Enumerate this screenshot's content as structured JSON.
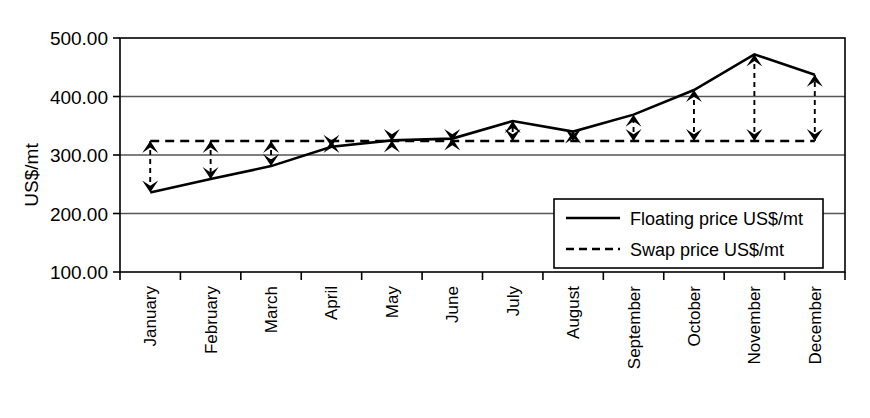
{
  "chart_data": {
    "type": "line",
    "title": "",
    "xlabel": "",
    "ylabel": "US$/mt",
    "ylim": [
      100,
      500
    ],
    "yticks": [
      "100.00",
      "200.00",
      "300.00",
      "400.00",
      "500.00"
    ],
    "ytick_values": [
      100,
      200,
      300,
      400,
      500
    ],
    "grid": true,
    "legend_position": "inside-lower-right",
    "categories": [
      "January",
      "February",
      "March",
      "April",
      "May",
      "June",
      "July",
      "August",
      "September",
      "October",
      "November",
      "December"
    ],
    "series": [
      {
        "name": "Floating price US$/mt",
        "style": "solid",
        "color": "#000000",
        "values": [
          236,
          259,
          281,
          314,
          325,
          328,
          358,
          340,
          369,
          411,
          472,
          437
        ]
      },
      {
        "name": "Swap price US$/mt",
        "style": "dashed",
        "color": "#000000",
        "values": [
          324,
          324,
          324,
          324,
          324,
          324,
          324,
          324,
          324,
          324,
          324,
          324
        ]
      }
    ],
    "annotations": {
      "description": "Double-headed dashed arrows connect swap price to floating price at each month",
      "arrows": [
        {
          "month": "January",
          "from": 324,
          "to": 236,
          "direction": "down"
        },
        {
          "month": "February",
          "from": 324,
          "to": 259,
          "direction": "down"
        },
        {
          "month": "March",
          "from": 324,
          "to": 281,
          "direction": "down"
        },
        {
          "month": "April",
          "from": 324,
          "to": 314,
          "direction": "down"
        },
        {
          "month": "May",
          "from": 324,
          "to": 325,
          "direction": "none"
        },
        {
          "month": "June",
          "from": 324,
          "to": 328,
          "direction": "none"
        },
        {
          "month": "July",
          "from": 324,
          "to": 358,
          "direction": "up"
        },
        {
          "month": "August",
          "from": 324,
          "to": 340,
          "direction": "up"
        },
        {
          "month": "September",
          "from": 324,
          "to": 369,
          "direction": "up"
        },
        {
          "month": "October",
          "from": 324,
          "to": 411,
          "direction": "up"
        },
        {
          "month": "November",
          "from": 324,
          "to": 472,
          "direction": "up"
        },
        {
          "month": "December",
          "from": 324,
          "to": 437,
          "direction": "up"
        }
      ]
    }
  },
  "legend": {
    "items": [
      {
        "label": "Floating price US$/mt",
        "style": "solid"
      },
      {
        "label": "Swap price US$/mt",
        "style": "dashed"
      }
    ]
  },
  "colors": {
    "ink": "#000000",
    "grid": "#555555",
    "background": "#ffffff"
  }
}
